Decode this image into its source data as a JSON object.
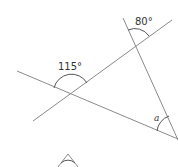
{
  "diagram": {
    "colors": {
      "line": "#8a8a8a",
      "arc": "#555555",
      "text": "#333333"
    },
    "angles": [
      {
        "id": "angle-115",
        "label": "115°"
      },
      {
        "id": "angle-80",
        "label": "80°"
      },
      {
        "id": "angle-a",
        "label": "a"
      }
    ]
  }
}
